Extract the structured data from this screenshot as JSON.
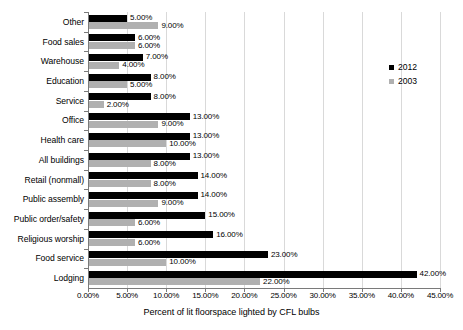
{
  "chart_data": {
    "type": "bar",
    "orientation": "horizontal",
    "title": "",
    "xlabel": "Percent of lit floorspace lighted by CFL bulbs",
    "ylabel": "",
    "xlim": [
      0,
      45
    ],
    "xtick_labels": [
      "0.00%",
      "5.00%",
      "10.00%",
      "15.00%",
      "20.00%",
      "25.00%",
      "30.00%",
      "35.00%",
      "40.00%",
      "45.00%"
    ],
    "xtick_values": [
      0,
      5,
      10,
      15,
      20,
      25,
      30,
      35,
      40,
      45
    ],
    "grid": true,
    "legend_position": "right",
    "categories": [
      "Other",
      "Food sales",
      "Warehouse",
      "Education",
      "Service",
      "Office",
      "Health care",
      "All buildings",
      "Retail (nonmall)",
      "Public assembly",
      "Public order/safety",
      "Religious worship",
      "Food service",
      "Lodging"
    ],
    "series": [
      {
        "name": "2012",
        "color": "#000000",
        "values": [
          5,
          6,
          7,
          8,
          8,
          13,
          13,
          13,
          14,
          14,
          15,
          16,
          23,
          42
        ],
        "labels": [
          "5.00%",
          "6.00%",
          "7.00%",
          "8.00%",
          "8.00%",
          "13.00%",
          "13.00%",
          "13.00%",
          "14.00%",
          "14.00%",
          "15.00%",
          "16.00%",
          "23.00%",
          "42.00%"
        ]
      },
      {
        "name": "2003",
        "color": "#b0b0b0",
        "values": [
          9,
          6,
          4,
          5,
          2,
          9,
          10,
          8,
          8,
          9,
          6,
          6,
          10,
          22
        ],
        "labels": [
          "9.00%",
          "6.00%",
          "4.00%",
          "5.00%",
          "2.00%",
          "9.00%",
          "10.00%",
          "8.00%",
          "8.00%",
          "9.00%",
          "6.00%",
          "6.00%",
          "10.00%",
          "22.00%"
        ]
      }
    ]
  },
  "legend": {
    "items": [
      {
        "label": "2012",
        "color": "#000000"
      },
      {
        "label": "2003",
        "color": "#b0b0b0"
      }
    ]
  }
}
